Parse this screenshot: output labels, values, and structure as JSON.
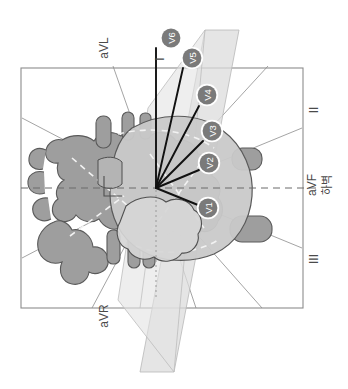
{
  "figure": {
    "orientation_note": "rotated-90-ccw",
    "background_color": "#ffffff"
  },
  "frame": {
    "name": "frontal-plane-box",
    "stroke": "#8c8c8c",
    "fill": "#ffffff",
    "x": 21,
    "y": 68,
    "width": 282,
    "height": 240
  },
  "plane": {
    "name": "sagittal-plane",
    "fill": "#d9d9d9",
    "fill_light": "#e6e6e6",
    "stroke": "#b0b0b0"
  },
  "origin": {
    "x": 156,
    "y": 188
  },
  "limb_leads": [
    {
      "id": "I",
      "label": "I",
      "x": 160,
      "y": 59,
      "rotate": -90,
      "axis_angle_deg": 0
    },
    {
      "id": "II",
      "label": "II",
      "x": 314,
      "y": 110,
      "rotate": -90,
      "axis_angle_deg": 60
    },
    {
      "id": "III",
      "label": "III",
      "x": 314,
      "y": 259,
      "rotate": -90,
      "axis_angle_deg": 120
    },
    {
      "id": "aVR",
      "label": "aVR",
      "x": 104,
      "y": 316,
      "rotate": -90,
      "axis_angle_deg": -150
    },
    {
      "id": "aVL",
      "label": "aVL",
      "x": 104,
      "y": 48,
      "rotate": -90,
      "axis_angle_deg": -30
    },
    {
      "id": "aVF",
      "label": "aVF",
      "x": 312,
      "y": 185,
      "rotate": -90,
      "axis_angle_deg": 90
    }
  ],
  "annotation": {
    "name": "inferior-wall-label",
    "text": "하벽",
    "x": 328,
    "y": 185,
    "rotate": -90
  },
  "precordial_leads": {
    "badge_fill": "#7a7a7a",
    "badge_ring": "#ffffff",
    "badge_text": "#ffffff",
    "items": [
      {
        "id": "V6",
        "label": "V6",
        "cx": 171,
        "cy": 38,
        "lead_x": 156,
        "lead_y": 62
      },
      {
        "id": "V5",
        "label": "V5",
        "cx": 192,
        "cy": 58,
        "lead_x": 178,
        "lead_y": 74
      },
      {
        "id": "V4",
        "label": "V4",
        "cx": 207,
        "cy": 95,
        "lead_x": 196,
        "lead_y": 108
      },
      {
        "id": "V3",
        "label": "V3",
        "cx": 212,
        "cy": 131,
        "lead_x": 201,
        "lead_y": 140
      },
      {
        "id": "V2",
        "label": "V2",
        "cx": 209,
        "cy": 163,
        "lead_x": 198,
        "lead_y": 168
      },
      {
        "id": "V1",
        "label": "V1",
        "cx": 208,
        "cy": 208,
        "lead_x": 197,
        "lead_y": 204
      }
    ]
  },
  "heart": {
    "name": "heart-illustration",
    "vessel_fill": "#9e9e9e",
    "vessel_stroke": "#5a5a5a",
    "ventricle_fill": "#c4c4c4",
    "ventricle_light": "#d2d2d2",
    "chamber_dash": "#f0f0f0"
  },
  "guides": {
    "horizontal_dash_color": "#6b6b6b",
    "vertical_dot_color": "#9a9a9a",
    "radial_line_color": "#9a9a9a"
  }
}
